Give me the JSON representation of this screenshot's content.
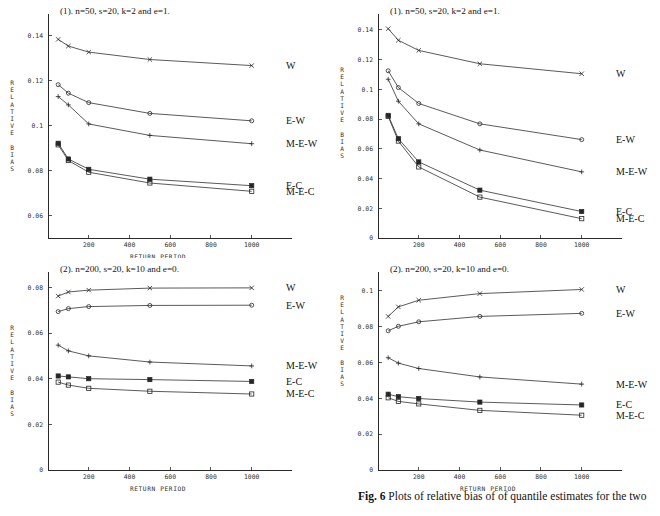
{
  "figure": {
    "caption_label": "Fig. 6",
    "caption_text": "Plots of relative bias of of quantile estimates for the two"
  },
  "axis": {
    "x_title": "RETURN PERIOD",
    "y_title": "RELATIVE BIAS",
    "y_title_letters": [
      "R",
      "E",
      "L",
      "A",
      "T",
      "I",
      "V",
      "E",
      "",
      "B",
      "I",
      "A",
      "S"
    ]
  },
  "chart_data": [
    {
      "id": "panel-tl",
      "type": "line",
      "title": "(1).  n=50, s=20, k=2 and e=1.",
      "xlabel": "RETURN PERIOD",
      "ylabel": "RELATIVE BIAS",
      "x": [
        50,
        100,
        200,
        500,
        1000
      ],
      "xlim": [
        0,
        1080
      ],
      "ylim": [
        0.05,
        0.148
      ],
      "xticks": [
        200,
        400,
        600,
        800,
        1000
      ],
      "xticklabels": [
        "200",
        "400",
        "600",
        "800",
        "1000"
      ],
      "yticks": [
        0.06,
        0.08,
        0.1,
        0.12,
        0.14
      ],
      "yticklabels": [
        "0.06",
        "0.08",
        "0.1",
        "0.12",
        "0.14"
      ],
      "grid": false,
      "legend": "right-inline",
      "series": [
        {
          "name": "W",
          "marker": "cross",
          "values": [
            0.1385,
            0.1355,
            0.1328,
            0.1295,
            0.1268
          ]
        },
        {
          "name": "E-W",
          "marker": "circle",
          "values": [
            0.1183,
            0.1145,
            0.1103,
            0.1055,
            0.1022
          ]
        },
        {
          "name": "M-E-W",
          "marker": "plus",
          "values": [
            0.113,
            0.1093,
            0.1008,
            0.0957,
            0.092
          ]
        },
        {
          "name": "E-C",
          "marker": "filled-square",
          "values": [
            0.0922,
            0.0852,
            0.0806,
            0.0762,
            0.0733
          ]
        },
        {
          "name": "M-E-C",
          "marker": "open-square",
          "values": [
            0.0915,
            0.0845,
            0.0793,
            0.0745,
            0.0708
          ]
        }
      ]
    },
    {
      "id": "panel-tr",
      "type": "line",
      "title": "(1).  n=50, s=20, k=2 and e=1.",
      "xlabel": "RETURN PERIOD",
      "ylabel": "RELATIVE BIAS",
      "x": [
        50,
        100,
        200,
        500,
        1000
      ],
      "xlim": [
        0,
        1080
      ],
      "ylim": [
        0,
        0.148
      ],
      "xticks": [
        200,
        400,
        600,
        800,
        1000
      ],
      "xticklabels": [
        "200",
        "400",
        "600",
        "800",
        "1000"
      ],
      "yticks": [
        0,
        0.02,
        0.04,
        0.06,
        0.08,
        0.1,
        0.12,
        0.14
      ],
      "yticklabels": [
        "0",
        "0.02",
        "0.04",
        "0.06",
        "0.08",
        "0.1",
        "0.12",
        "0.14"
      ],
      "grid": false,
      "legend": "right-inline",
      "series": [
        {
          "name": "W",
          "marker": "cross",
          "values": [
            0.1408,
            0.133,
            0.1262,
            0.1172,
            0.1105
          ]
        },
        {
          "name": "E-W",
          "marker": "circle",
          "values": [
            0.1125,
            0.1012,
            0.0905,
            0.0768,
            0.0662
          ]
        },
        {
          "name": "M-E-W",
          "marker": "plus",
          "values": [
            0.1068,
            0.092,
            0.0768,
            0.0592,
            0.0445
          ]
        },
        {
          "name": "E-C",
          "marker": "filled-square",
          "values": [
            0.0825,
            0.0668,
            0.0512,
            0.0322,
            0.0178
          ]
        },
        {
          "name": "M-E-C",
          "marker": "open-square",
          "values": [
            0.0818,
            0.0652,
            0.0478,
            0.0275,
            0.013
          ]
        }
      ]
    },
    {
      "id": "panel-bl",
      "type": "line",
      "title": "(2).  n=200, s=20, k=10 and e=0.",
      "xlabel": "RETURN PERIOD",
      "ylabel": "RELATIVE BIAS",
      "x": [
        50,
        100,
        200,
        500,
        1000
      ],
      "xlim": [
        0,
        1080
      ],
      "ylim": [
        0,
        0.085
      ],
      "xticks": [
        200,
        400,
        600,
        800,
        1000
      ],
      "xticklabels": [
        "200",
        "400",
        "600",
        "800",
        "1000"
      ],
      "yticks": [
        0,
        0.02,
        0.04,
        0.06,
        0.08
      ],
      "yticklabels": [
        "0",
        "0.02",
        "0.04",
        "0.06",
        "0.08"
      ],
      "grid": false,
      "legend": "right-inline",
      "series": [
        {
          "name": "W",
          "marker": "cross",
          "values": [
            0.0762,
            0.078,
            0.0788,
            0.0797,
            0.0798
          ]
        },
        {
          "name": "E-W",
          "marker": "circle",
          "values": [
            0.0694,
            0.0707,
            0.0716,
            0.0721,
            0.0722
          ]
        },
        {
          "name": "M-E-W",
          "marker": "plus",
          "values": [
            0.0547,
            0.0522,
            0.05,
            0.0473,
            0.0456
          ]
        },
        {
          "name": "E-C",
          "marker": "filled-square",
          "values": [
            0.0412,
            0.0408,
            0.04,
            0.0396,
            0.0388
          ]
        },
        {
          "name": "M-E-C",
          "marker": "open-square",
          "values": [
            0.0385,
            0.0372,
            0.0358,
            0.0345,
            0.0333
          ]
        }
      ]
    },
    {
      "id": "panel-br",
      "type": "line",
      "title": "(2).  n=200, s=20, k=10 and e=0.",
      "xlabel": "RETURN PERIOD",
      "ylabel": "RELATIVE BIAS",
      "x": [
        50,
        100,
        200,
        500,
        1000
      ],
      "xlim": [
        0,
        1080
      ],
      "ylim": [
        0,
        0.108
      ],
      "xticks": [
        200,
        400,
        600,
        800,
        1000
      ],
      "xticklabels": [
        "200",
        "400",
        "600",
        "800",
        "1000"
      ],
      "yticks": [
        0,
        0.02,
        0.04,
        0.06,
        0.08,
        0.1
      ],
      "yticklabels": [
        "0",
        "0.02",
        "0.04",
        "0.06",
        "0.08",
        "0.1"
      ],
      "grid": false,
      "legend": "right-inline",
      "series": [
        {
          "name": "W",
          "marker": "cross",
          "values": [
            0.0855,
            0.0908,
            0.0945,
            0.0982,
            0.1005
          ]
        },
        {
          "name": "E-W",
          "marker": "circle",
          "values": [
            0.0775,
            0.08,
            0.0825,
            0.0855,
            0.0872
          ]
        },
        {
          "name": "M-E-W",
          "marker": "plus",
          "values": [
            0.0625,
            0.0595,
            0.0565,
            0.0518,
            0.0478
          ]
        },
        {
          "name": "E-C",
          "marker": "filled-square",
          "values": [
            0.0422,
            0.0408,
            0.0398,
            0.0378,
            0.0362
          ]
        },
        {
          "name": "M-E-C",
          "marker": "open-square",
          "values": [
            0.0402,
            0.0382,
            0.0368,
            0.0332,
            0.0305
          ]
        }
      ]
    }
  ]
}
